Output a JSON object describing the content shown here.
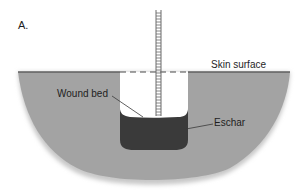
{
  "figure": {
    "panel_label": "A.",
    "labels": {
      "skin_surface": "Skin surface",
      "wound_bed": "Wound bed",
      "eschar": "Eschar"
    }
  },
  "colors": {
    "background": "#ffffff",
    "tissue": "#a3a3a3",
    "tissue_edge": "#5f5f5f",
    "eschar": "#3a3a3a",
    "wound_cavity": "#ffffff",
    "ruler": "#6a6a6a",
    "text": "#1e1e1e"
  }
}
